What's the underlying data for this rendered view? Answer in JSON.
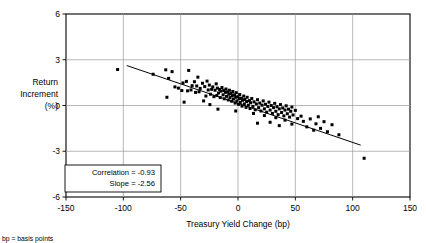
{
  "chart_data": {
    "type": "scatter",
    "title": "",
    "xlabel": "Treasury Yield Change (bp)",
    "ylabel": "Return Increment (%)",
    "ylabel_lines": [
      "Return",
      "Increment",
      "(%)"
    ],
    "xlim": [
      -150,
      150
    ],
    "ylim": [
      -6,
      6
    ],
    "xticks": [
      -150,
      -100,
      -50,
      0,
      50,
      100,
      150
    ],
    "yticks": [
      6,
      3,
      0,
      -3,
      -6
    ],
    "xtick_labels": [
      "-150",
      "-100",
      "-50",
      "0",
      "50",
      "100",
      "150"
    ],
    "ytick_labels": [
      "6",
      "3",
      "0",
      "-3",
      "-6"
    ],
    "grid": true,
    "legend": "none",
    "marker": "square",
    "marker_color": "#000000",
    "annotations": {
      "correlation_label": "Correlation = -0.93",
      "slope_label": "Slope = -2.56",
      "correlation_value": -0.93,
      "slope_value": -2.56
    },
    "footnote": "bp = basis points",
    "fit_line": {
      "x_start": -97,
      "y_start": 2.62,
      "x_end": 107,
      "y_end": -2.6
    },
    "points": [
      [
        -105.0,
        2.36
      ],
      [
        -74.0,
        2.05
      ],
      [
        -63.0,
        2.34
      ],
      [
        -60.5,
        1.78
      ],
      [
        -57.5,
        2.22
      ],
      [
        -55.0,
        1.22
      ],
      [
        -52.0,
        1.14
      ],
      [
        -49.0,
        0.98
      ],
      [
        -48.0,
        1.48
      ],
      [
        -45.0,
        1.58
      ],
      [
        -44.0,
        0.96
      ],
      [
        -43.0,
        2.3
      ],
      [
        -41.0,
        1.02
      ],
      [
        -40.0,
        1.3
      ],
      [
        -38.0,
        1.56
      ],
      [
        -37.0,
        0.86
      ],
      [
        -36.0,
        1.28
      ],
      [
        -35.0,
        1.86
      ],
      [
        -34.0,
        0.9
      ],
      [
        -33.0,
        1.12
      ],
      [
        -31.0,
        1.46
      ],
      [
        -30.0,
        0.3
      ],
      [
        -29.0,
        1.24
      ],
      [
        -28.0,
        0.62
      ],
      [
        -27.0,
        1.6
      ],
      [
        -26.0,
        1.02
      ],
      [
        -25.0,
        1.34
      ],
      [
        -24.0,
        0.74
      ],
      [
        -23.0,
        1.06
      ],
      [
        -22.0,
        1.22
      ],
      [
        -21.0,
        0.58
      ],
      [
        -20.0,
        1.0
      ],
      [
        -19.0,
        1.42
      ],
      [
        -18.5,
        0.66
      ],
      [
        -18.0,
        1.14
      ],
      [
        -17.0,
        0.82
      ],
      [
        -16.0,
        1.05
      ],
      [
        -15.5,
        0.52
      ],
      [
        -15.0,
        0.94
      ],
      [
        -14.0,
        1.18
      ],
      [
        -13.0,
        0.7
      ],
      [
        -12.5,
        0.98
      ],
      [
        -12.0,
        0.44
      ],
      [
        -11.0,
        0.86
      ],
      [
        -10.5,
        1.08
      ],
      [
        -10.0,
        0.6
      ],
      [
        -9.0,
        0.9
      ],
      [
        -8.5,
        0.36
      ],
      [
        -8.0,
        0.74
      ],
      [
        -7.5,
        1.0
      ],
      [
        -7.0,
        0.52
      ],
      [
        -6.0,
        0.8
      ],
      [
        -5.5,
        0.28
      ],
      [
        -5.0,
        0.64
      ],
      [
        -4.5,
        0.92
      ],
      [
        -4.0,
        0.42
      ],
      [
        -3.0,
        0.7
      ],
      [
        -2.5,
        0.16
      ],
      [
        -2.0,
        0.54
      ],
      [
        -1.5,
        0.84
      ],
      [
        -1.0,
        0.3
      ],
      [
        0.0,
        0.58
      ],
      [
        0.5,
        0.08
      ],
      [
        1.0,
        0.44
      ],
      [
        1.5,
        0.72
      ],
      [
        2.0,
        0.2
      ],
      [
        3.0,
        0.48
      ],
      [
        3.5,
        -0.04
      ],
      [
        4.0,
        0.34
      ],
      [
        5.0,
        0.62
      ],
      [
        5.5,
        0.1
      ],
      [
        6.0,
        0.4
      ],
      [
        7.0,
        -0.12
      ],
      [
        7.5,
        0.26
      ],
      [
        8.0,
        0.54
      ],
      [
        9.0,
        0.02
      ],
      [
        10.0,
        0.32
      ],
      [
        10.5,
        -0.2
      ],
      [
        11.0,
        0.18
      ],
      [
        12.0,
        0.46
      ],
      [
        13.0,
        -0.06
      ],
      [
        14.0,
        0.24
      ],
      [
        15.0,
        -0.28
      ],
      [
        16.0,
        0.1
      ],
      [
        17.0,
        0.38
      ],
      [
        18.0,
        -0.14
      ],
      [
        19.0,
        0.16
      ],
      [
        20.0,
        -0.36
      ],
      [
        21.0,
        0.02
      ],
      [
        22.0,
        0.3
      ],
      [
        23.0,
        -0.22
      ],
      [
        24.0,
        0.08
      ],
      [
        25.0,
        -0.44
      ],
      [
        26.0,
        -0.06
      ],
      [
        27.0,
        0.22
      ],
      [
        28.0,
        -0.3
      ],
      [
        29.0,
        0.0
      ],
      [
        30.0,
        -0.52
      ],
      [
        31.0,
        -0.14
      ],
      [
        32.0,
        0.14
      ],
      [
        33.0,
        -0.38
      ],
      [
        34.0,
        -0.08
      ],
      [
        35.0,
        -0.6
      ],
      [
        36.0,
        -0.22
      ],
      [
        37.0,
        0.06
      ],
      [
        38.0,
        -0.46
      ],
      [
        39.0,
        -0.16
      ],
      [
        40.0,
        -0.68
      ],
      [
        41.0,
        -0.3
      ],
      [
        42.0,
        -0.02
      ],
      [
        43.0,
        -0.54
      ],
      [
        44.0,
        -0.24
      ],
      [
        45.0,
        -0.76
      ],
      [
        46.0,
        -0.38
      ],
      [
        47.0,
        -0.1
      ],
      [
        48.0,
        -0.62
      ],
      [
        50.0,
        -0.32
      ],
      [
        52.0,
        -0.86
      ],
      [
        -62.0,
        0.54
      ],
      [
        -47.0,
        0.22
      ],
      [
        -24.5,
        0.06
      ],
      [
        -17.5,
        -0.24
      ],
      [
        -2.0,
        -0.36
      ],
      [
        13.5,
        -0.52
      ],
      [
        23.0,
        -0.66
      ],
      [
        33.0,
        -0.8
      ],
      [
        17.0,
        -1.16
      ],
      [
        28.0,
        -1.1
      ],
      [
        36.0,
        -1.32
      ],
      [
        41.0,
        -0.96
      ],
      [
        47.0,
        -1.22
      ],
      [
        55.0,
        -0.7
      ],
      [
        57.0,
        -1.04
      ],
      [
        60.0,
        -1.4
      ],
      [
        63.0,
        -0.88
      ],
      [
        66.0,
        -1.62
      ],
      [
        68.0,
        -1.2
      ],
      [
        70.0,
        -0.74
      ],
      [
        72.0,
        -1.5
      ],
      [
        75.0,
        -1.06
      ],
      [
        78.0,
        -1.72
      ],
      [
        82.0,
        -1.26
      ],
      [
        88.0,
        -1.92
      ],
      [
        110.0,
        -3.46
      ]
    ]
  }
}
